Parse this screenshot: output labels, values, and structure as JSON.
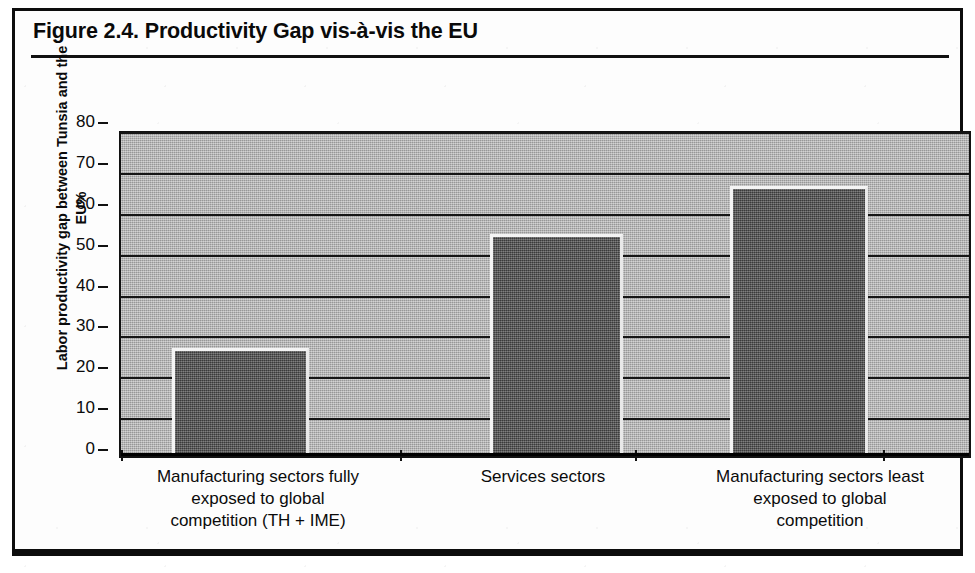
{
  "figure": {
    "title": "Figure 2.4.  Productivity Gap vis-à-vis the EU"
  },
  "chart_data": {
    "type": "bar",
    "title": "Figure 2.4.  Productivity Gap vis-à-vis the EU",
    "xlabel": "",
    "ylabel": "Labor productivity gap between Tunsia and the EU%",
    "categories": [
      "Manufacturing sectors fully exposed to global competition (TH + IME)",
      "Services sectors",
      "Manufacturing sectors least exposed to global competition"
    ],
    "values": [
      26.5,
      54.3,
      66.0
    ],
    "ylim": [
      0,
      80
    ],
    "yticks": [
      0,
      10,
      20,
      30,
      40,
      50,
      60,
      70,
      80
    ],
    "ytick_labels": [
      "0",
      "10",
      "20",
      "30",
      "40",
      "50",
      "60",
      "70",
      "80"
    ],
    "grid": true,
    "legend": null,
    "colors": {
      "bar_fill": "#565656",
      "bar_highlight": "#f4f4f4",
      "plot_background": "#a9a9a9",
      "axis": "#111111",
      "page_background": "#ffffff",
      "text": "#0a0a0a"
    }
  },
  "axis": {
    "y_title_lines": [
      "Labor productivity gap between Tunsia and the",
      "EU%"
    ],
    "y_tick_labels": [
      "80",
      "70",
      "60",
      "50",
      "40",
      "30",
      "20",
      "10",
      "0"
    ]
  },
  "category_labels": [
    [
      "Manufacturing sectors fully",
      "exposed to global",
      "competition (TH + IME)"
    ],
    [
      "Services sectors"
    ],
    [
      "Manufacturing sectors least",
      "exposed to global",
      "competition"
    ]
  ]
}
